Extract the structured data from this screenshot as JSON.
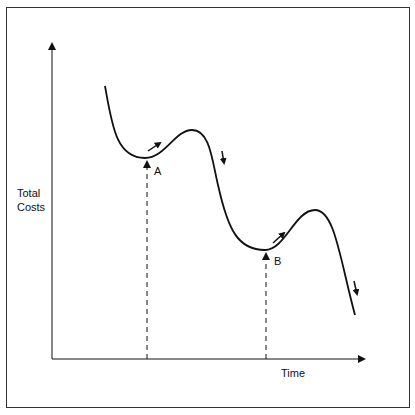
{
  "diagram": {
    "y_axis_label_line1": "Total",
    "y_axis_label_line2": "Costs",
    "x_axis_label": "Time",
    "points": [
      {
        "label": "A"
      },
      {
        "label": "B"
      }
    ],
    "colors": {
      "line": "#111111",
      "frame": "#333333",
      "background": "#ffffff"
    }
  }
}
